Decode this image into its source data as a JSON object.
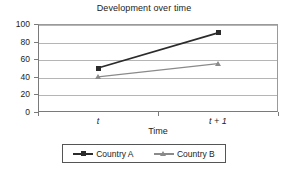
{
  "chart_data": {
    "type": "line",
    "title": "Development over time",
    "xlabel": "Time",
    "ylabel": "",
    "categories": [
      "t",
      "t + 1"
    ],
    "ylim": [
      0,
      100
    ],
    "yticks": [
      0,
      20,
      40,
      60,
      80,
      100
    ],
    "ytick_labels": [
      "0",
      "20",
      "40",
      "60",
      "80",
      "100"
    ],
    "grid": "horizontal",
    "legend_position": "bottom",
    "series": [
      {
        "name": "Country A",
        "values": [
          50,
          90
        ],
        "color": "#2b2b2b",
        "marker": "square"
      },
      {
        "name": "Country B",
        "values": [
          40,
          55
        ],
        "color": "#8a8a8a",
        "marker": "triangle"
      }
    ]
  },
  "legend": {
    "entries": [
      {
        "label": "Country A"
      },
      {
        "label": "Country B"
      }
    ]
  }
}
